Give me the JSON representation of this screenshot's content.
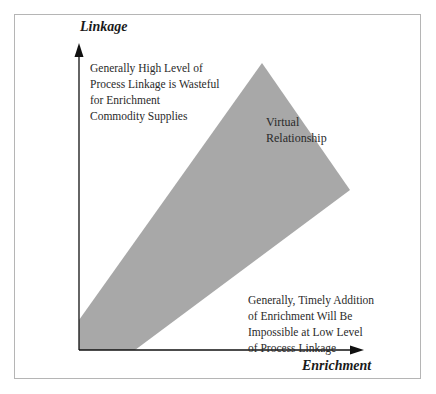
{
  "diagram": {
    "type": "conceptual-region-diagram",
    "axes": {
      "y": {
        "title": "Linkage"
      },
      "x": {
        "title": "Enrichment"
      }
    },
    "region": {
      "label": "Virtual Relationship",
      "label_lines": [
        "Virtual",
        "Relationship"
      ],
      "fill_color": "#a8a8a8"
    },
    "annotations": {
      "upper_left": {
        "lines": [
          "Generally High Level of",
          "Process Linkage is Wasteful",
          "for Enrichment",
          "Commodity Supplies"
        ]
      },
      "lower_right": {
        "lines": [
          "Generally, Timely Addition",
          "of Enrichment Will Be",
          "Impossible at Low Level",
          "of Process Linkage"
        ]
      }
    },
    "colors": {
      "axis": "#111111",
      "frame": "#b5b5b5",
      "region": "#a8a8a8"
    }
  }
}
